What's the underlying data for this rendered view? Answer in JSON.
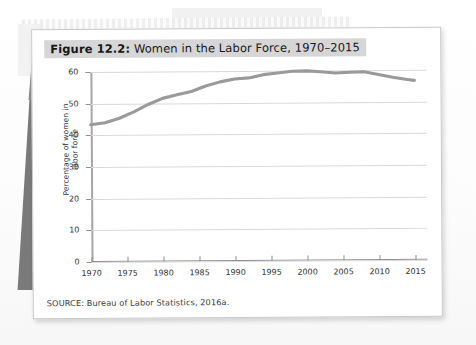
{
  "figure": {
    "label": "Figure 12.2:",
    "title": "Women in the Labor Force, 1970–2015",
    "full_title": "Figure 12.2: Women in the Labor Force, 1970–2015",
    "source": "SOURCE: Bureau of Labor Statistics, 2016a."
  },
  "colors": {
    "line": "#9a9a9a",
    "grid": "#d9d9d9",
    "axis": "#8f8f8f",
    "title_band": "#d6d6d6",
    "page": "#ffffff",
    "wedge": "#7a7a7a"
  },
  "chart_data": {
    "type": "line",
    "title": "Women in the Labor Force, 1970–2015",
    "xlabel": "",
    "ylabel": "Percentage of women in labor force",
    "xlim": [
      1970,
      2015
    ],
    "ylim": [
      0,
      60
    ],
    "grid": true,
    "legend": "none",
    "ytick_labels": [
      "0",
      "10",
      "20",
      "30",
      "40",
      "50",
      "60"
    ],
    "yticks": [
      0,
      10,
      20,
      30,
      40,
      50,
      60
    ],
    "xtick_labels": [
      "1970",
      "1975",
      "1980",
      "1985",
      "1990",
      "1995",
      "2000",
      "2005",
      "2010",
      "2015"
    ],
    "xticks": [
      1970,
      1975,
      1980,
      1985,
      1990,
      1995,
      2000,
      2005,
      2010,
      2015
    ],
    "x": [
      1970,
      1972,
      1974,
      1976,
      1978,
      1980,
      1982,
      1984,
      1986,
      1988,
      1990,
      1992,
      1994,
      1996,
      1998,
      2000,
      2002,
      2004,
      2006,
      2008,
      2010,
      2012,
      2014,
      2015
    ],
    "values": [
      43.3,
      43.9,
      45.3,
      47.3,
      49.6,
      51.5,
      52.6,
      53.6,
      55.3,
      56.6,
      57.5,
      57.8,
      58.8,
      59.3,
      59.8,
      59.9,
      59.6,
      59.2,
      59.4,
      59.5,
      58.6,
      57.7,
      57.0,
      56.7
    ],
    "series": [
      {
        "name": "Percentage of women in labor force",
        "values": [
          43.3,
          43.9,
          45.3,
          47.3,
          49.6,
          51.5,
          52.6,
          53.6,
          55.3,
          56.6,
          57.5,
          57.8,
          58.8,
          59.3,
          59.8,
          59.9,
          59.6,
          59.2,
          59.4,
          59.5,
          58.6,
          57.7,
          57.0,
          56.7
        ]
      }
    ],
    "notes": {
      "start_value": 43.3,
      "peak_value": 59.9,
      "peak_year": 2000,
      "end_value": 56.7,
      "end_year": 2015
    }
  }
}
